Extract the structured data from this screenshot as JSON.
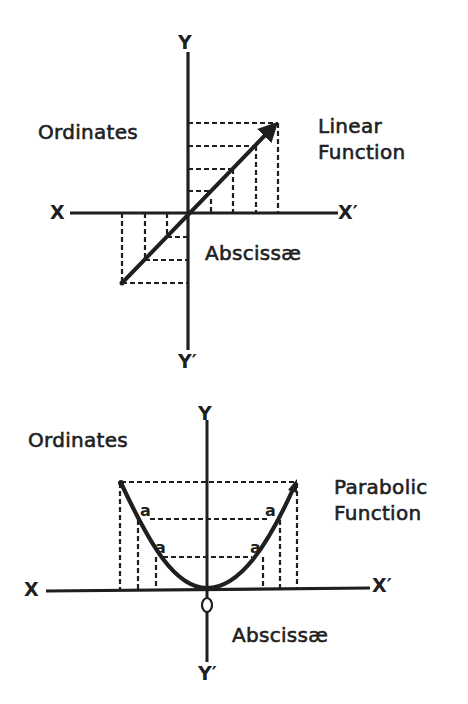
{
  "diagrams": [
    {
      "title": "Linear Function",
      "labels": {
        "y_top": "Y",
        "y_bottom": "Y′",
        "x_left": "X",
        "x_right": "X′",
        "ordinates": "Ordinates",
        "abscissae": "Abscissæ",
        "function_line1": "Linear",
        "function_line2": "Function"
      }
    },
    {
      "title": "Parabolic Function",
      "labels": {
        "y_top": "Y",
        "y_bottom": "Y′",
        "x_left": "X",
        "x_right": "X′",
        "origin": "O",
        "ordinates": "Ordinates",
        "abscissae": "Abscissæ",
        "function_line1": "Parabolic",
        "function_line2": "Function",
        "point_marker": "a"
      }
    }
  ],
  "colors": {
    "ink": "#1f1f1f",
    "background": "#ffffff"
  }
}
